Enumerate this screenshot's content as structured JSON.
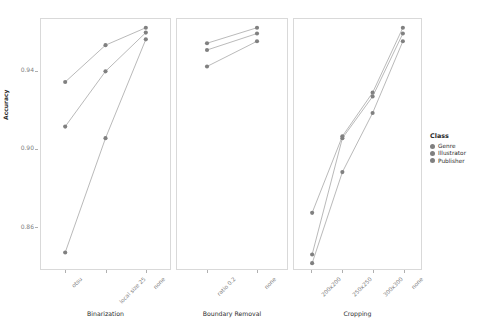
{
  "chart_data": {
    "type": "line",
    "title": "",
    "xlabel": "",
    "ylabel": "Accuracy",
    "ylim": [
      0.838,
      0.967
    ],
    "y_ticks": [
      0.94,
      0.9,
      0.86
    ],
    "y_tick_labels": [
      "0.94",
      "0.90",
      "0.86"
    ],
    "grid": false,
    "legend_position": "right",
    "legend_title": "Class",
    "point_color": "#808080",
    "line_color": "#9a9a9a",
    "panel_border_color": "#d9d9d9",
    "facets": [
      {
        "name": "Binarization",
        "categories": [
          "otsu",
          "local size 25",
          "none"
        ],
        "series": [
          {
            "name": "Genre",
            "values": [
              0.9345,
              0.9535,
              0.9625
            ]
          },
          {
            "name": "Illustrator",
            "values": [
              0.9115,
              0.94,
              0.96
            ]
          },
          {
            "name": "Publisher",
            "values": [
              0.8465,
              0.9055,
              0.9565
            ]
          }
        ]
      },
      {
        "name": "Boundary Removal",
        "categories": [
          "ratio 0.2",
          "none"
        ],
        "series": [
          {
            "name": "Genre",
            "values": [
              0.9545,
              0.9625
            ]
          },
          {
            "name": "Illustrator",
            "values": [
              0.951,
              0.9595
            ]
          },
          {
            "name": "Publisher",
            "values": [
              0.9425,
              0.9555
            ]
          }
        ]
      },
      {
        "name": "Cropping",
        "categories": [
          "200x200",
          "250x250",
          "300x300",
          "none"
        ],
        "series": [
          {
            "name": "Genre",
            "values": [
              0.867,
              0.9065,
              0.929,
              0.9625
            ]
          },
          {
            "name": "Illustrator",
            "values": [
              0.8455,
              0.9055,
              0.927,
              0.9595
            ]
          },
          {
            "name": "Publisher",
            "values": [
              0.841,
              0.888,
              0.9185,
              0.9555
            ]
          }
        ]
      }
    ],
    "legend_entries": [
      {
        "label": "Genre",
        "color": "#808080"
      },
      {
        "label": "Illustrator",
        "color": "#808080"
      },
      {
        "label": "Publisher",
        "color": "#808080"
      }
    ]
  }
}
